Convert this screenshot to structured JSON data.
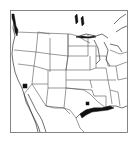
{
  "map": {
    "type": "species-distribution-map",
    "region": "United States and northern Mexico",
    "colors": {
      "background": "#ffffff",
      "outline": "#555555",
      "distribution": "#111111"
    },
    "distribution_markers": [
      {
        "label": "Pacific Northwest coast (Washington)",
        "shape": "coastal-band"
      },
      {
        "label": "Southern California",
        "shape": "spot"
      },
      {
        "label": "Texas Gulf Coast",
        "shape": "coastal-band"
      },
      {
        "label": "Central Texas",
        "shape": "spot"
      },
      {
        "label": "Lake Superior north shore",
        "shape": "coastal-band"
      },
      {
        "label": "Western Ontario lakes",
        "shape": "patches"
      }
    ]
  }
}
